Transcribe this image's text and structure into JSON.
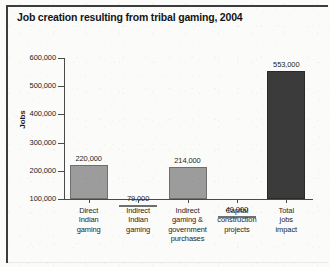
{
  "chart_data": {
    "type": "bar",
    "title": "Job creation resulting from tribal gaming, 2004",
    "xlabel": "",
    "ylabel": "Jobs",
    "ylim": [
      100000,
      600000
    ],
    "ytick_labels": [
      "600,000",
      "500,000",
      "400,000",
      "300,000",
      "200,000",
      "100,000"
    ],
    "ytick_values": [
      600000,
      500000,
      400000,
      300000,
      200000,
      100000
    ],
    "grid": false,
    "legend": "none",
    "baseline_note": "Bars are drawn from the truncated 100,000 axis floor",
    "categories": [
      "Direct Indian gaming",
      "Indirect Indian gaming",
      "Indirect gaming & government purchases",
      "Capital construction projects",
      "Total jobs impact"
    ],
    "category_lines": [
      [
        "Direct",
        "Indian",
        "gaming"
      ],
      [
        "Indirect",
        "Indian",
        "gaming"
      ],
      [
        "Indirect",
        "gaming &",
        "government",
        "purchases"
      ],
      [
        "Capital",
        "construction",
        "projects"
      ],
      [
        "Total",
        "jobs",
        "impact"
      ]
    ],
    "values": [
      220000,
      79000,
      214000,
      40000,
      553000
    ],
    "value_labels": [
      "220,000",
      "79,000",
      "214,000",
      "40,000",
      "553,000"
    ],
    "bar_colors": [
      "#9c9c9c",
      "#9c9c9c",
      "#9c9c9c",
      "#9c9c9c",
      "#3b3b3b"
    ]
  },
  "colors": {
    "bar_light": "#9c9c9c",
    "bar_dark": "#3b3b3b",
    "axis": "#4a4a4a",
    "frame": "#3c3c3c",
    "page_background": "#fbfbfa",
    "text": "#1a1a1a"
  }
}
